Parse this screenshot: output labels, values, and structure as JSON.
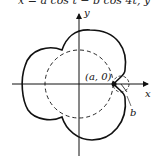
{
  "header": {
    "formula_fragment": "x = a cos t − b cos 4t, y"
  },
  "diagram": {
    "axes": {
      "x_label": "x",
      "y_label": "y"
    },
    "point_label": "(a, 0)",
    "radius_label": "b",
    "curve": "epicycloid-like with 4 lobes",
    "dashed_circle": "base circle radius a",
    "small_dashed_circle": "rolling circle radius b"
  }
}
